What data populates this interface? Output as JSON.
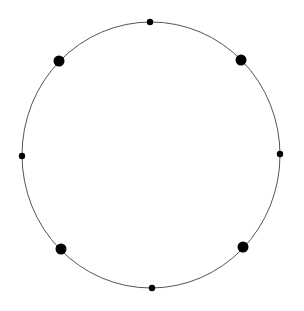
{
  "diagram": {
    "type": "circle-with-nodes",
    "background": "#ffffff",
    "ring": {
      "cx": 151,
      "cy": 155,
      "rx": 129,
      "ry": 133,
      "stroke": "#555555",
      "stroke_width": 1
    },
    "node_color": "#000000",
    "nodes": [
      {
        "id": "top",
        "cx": 150,
        "cy": 22,
        "r": 3.2,
        "size": "small"
      },
      {
        "id": "upper-right",
        "cx": 241,
        "cy": 60,
        "r": 5.5,
        "size": "large"
      },
      {
        "id": "right",
        "cx": 280,
        "cy": 154,
        "r": 3.2,
        "size": "small"
      },
      {
        "id": "lower-right",
        "cx": 243,
        "cy": 247,
        "r": 5.5,
        "size": "large"
      },
      {
        "id": "bottom",
        "cx": 152,
        "cy": 288,
        "r": 3.2,
        "size": "small"
      },
      {
        "id": "lower-left",
        "cx": 61,
        "cy": 249,
        "r": 5.5,
        "size": "large"
      },
      {
        "id": "left",
        "cx": 22,
        "cy": 156,
        "r": 3.2,
        "size": "small"
      },
      {
        "id": "upper-left",
        "cx": 59,
        "cy": 61,
        "r": 5.5,
        "size": "large"
      }
    ]
  }
}
